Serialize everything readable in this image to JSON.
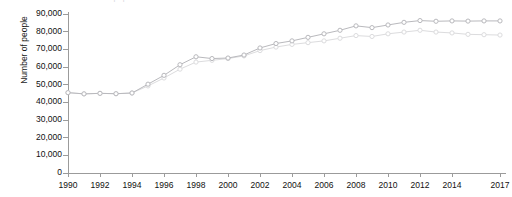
{
  "chart_data": {
    "type": "line",
    "title": "Prison population",
    "xlabel": "",
    "ylabel": "Number of people",
    "x": [
      1990,
      1991,
      1992,
      1993,
      1994,
      1995,
      1996,
      1997,
      1998,
      1999,
      2000,
      2001,
      2002,
      2003,
      2004,
      2005,
      2006,
      2007,
      2008,
      2009,
      2010,
      2011,
      2012,
      2013,
      2014,
      2015,
      2016,
      2017
    ],
    "xlim": [
      1990,
      2017
    ],
    "ylim": [
      0,
      90000
    ],
    "yticks": [
      0,
      10000,
      20000,
      30000,
      40000,
      50000,
      60000,
      70000,
      80000,
      90000
    ],
    "ytick_labels": [
      "0",
      "10,000",
      "20,000",
      "30,000",
      "40,000",
      "50,000",
      "60,000",
      "70,000",
      "80,000",
      "90,000"
    ],
    "xtick_labels": [
      "1990",
      "1992",
      "1994",
      "1996",
      "1998",
      "2000",
      "2002",
      "2004",
      "2006",
      "2008",
      "2010",
      "2012",
      "2014",
      "2017"
    ],
    "xticks_major": [
      1990,
      1992,
      1994,
      1996,
      1998,
      2000,
      2002,
      2004,
      2006,
      2008,
      2010,
      2012,
      2014,
      2017
    ],
    "grid": false,
    "legend": "none",
    "marker": "open-circle",
    "series": [
      {
        "name": "Series 1",
        "color": "#b9b9bd",
        "values": [
          45200,
          44500,
          44800,
          44600,
          45000,
          50000,
          55000,
          61000,
          65500,
          64500,
          64800,
          66500,
          70500,
          73000,
          74500,
          76500,
          78500,
          80500,
          83000,
          82000,
          83500,
          85000,
          86000,
          85600,
          85800,
          85700,
          85800,
          85800
        ]
      },
      {
        "name": "Series 2",
        "color": "#dcdcde",
        "values": [
          45200,
          44500,
          44800,
          44600,
          45000,
          49000,
          53500,
          58500,
          62500,
          63500,
          64500,
          66000,
          69000,
          71000,
          72500,
          73500,
          74500,
          76000,
          77500,
          77000,
          78500,
          79500,
          80500,
          79500,
          79000,
          78200,
          78000,
          77800
        ]
      }
    ]
  }
}
